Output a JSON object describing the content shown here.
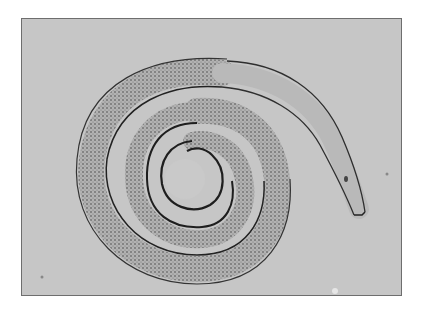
{
  "image": {
    "subject": "coiled nematode larva under light microscope",
    "background_color": "#c6c6c6",
    "border_color": "#6e6e6e",
    "worm_outline_color": "#2a2a2a",
    "worm_body_color": "#b4b4b4",
    "granule_color": "#555555"
  }
}
